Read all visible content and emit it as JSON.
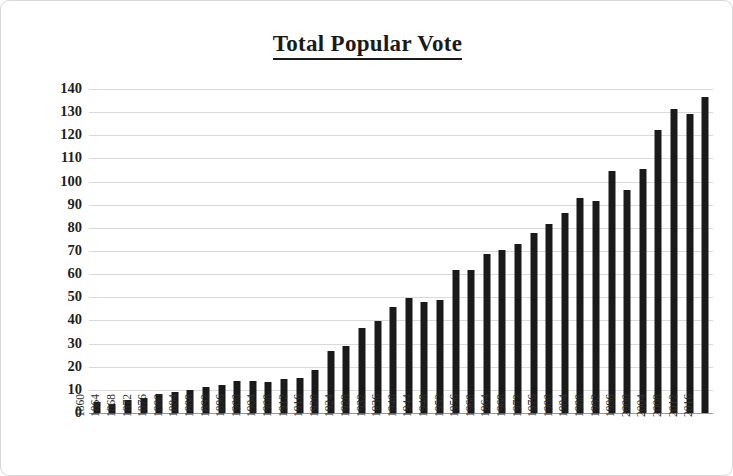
{
  "chart_data": {
    "type": "bar",
    "title": "Total Popular Vote",
    "xlabel": "",
    "ylabel": "# of votes, in millions",
    "ylim": [
      0,
      140
    ],
    "ytick_values": [
      0,
      10,
      20,
      30,
      40,
      50,
      60,
      70,
      80,
      90,
      100,
      110,
      120,
      130,
      140
    ],
    "ytick_labels": [
      "0",
      "10",
      "20",
      "30",
      "40",
      "50",
      "60",
      "70",
      "80",
      "90",
      "100",
      "110",
      "120",
      "130",
      "140"
    ],
    "grid": true,
    "legend": "none",
    "bar_color": "#1a1a1a",
    "categories": [
      "1860",
      "1864",
      "1868",
      "1872",
      "1876",
      "1880",
      "1884",
      "1888",
      "1892",
      "1896",
      "1900",
      "1904",
      "1908",
      "1912",
      "1916",
      "1920",
      "1924",
      "1928",
      "1932",
      "1936",
      "1940",
      "1944",
      "1948",
      "1952",
      "1956",
      "1960",
      "1964",
      "1968",
      "1972",
      "1976",
      "1980",
      "1984",
      "1988",
      "1992",
      "1996",
      "2000",
      "2004",
      "2008",
      "2012",
      "2016"
    ],
    "values": [
      4.7,
      4.0,
      5.7,
      6.5,
      8.4,
      9.2,
      10.1,
      11.4,
      12.1,
      13.9,
      13.9,
      13.5,
      14.9,
      15.0,
      18.5,
      26.8,
      29.1,
      36.8,
      39.7,
      45.6,
      49.9,
      48.0,
      48.8,
      61.6,
      62.0,
      68.8,
      70.6,
      73.2,
      77.7,
      81.6,
      86.5,
      92.7,
      91.6,
      104.4,
      96.3,
      105.4,
      122.3,
      131.3,
      129.1,
      136.7
    ]
  }
}
